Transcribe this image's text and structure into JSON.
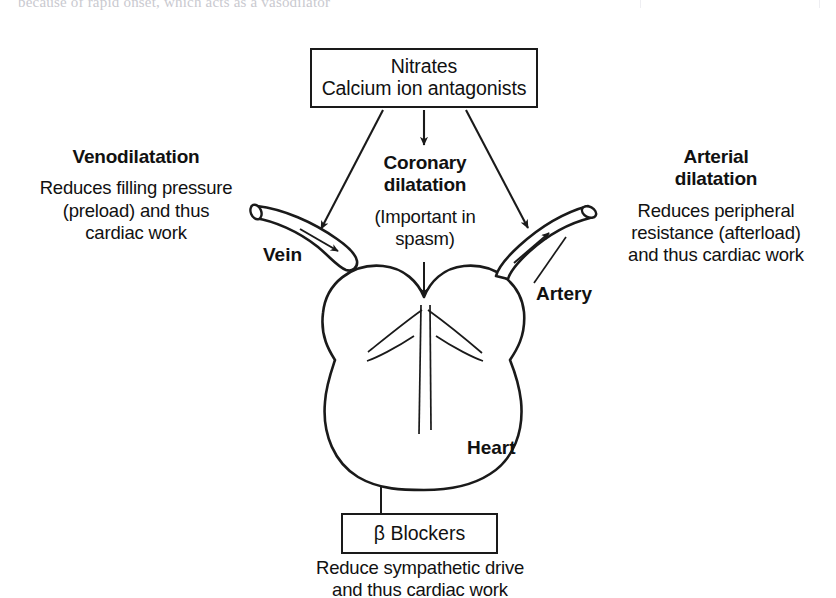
{
  "page": {
    "bleed_text_top": "because of rapid onset, which acts as a vasodilator",
    "background_color": "#ffffff",
    "ink_color": "#1a1a1a"
  },
  "diagram": {
    "drug_box": {
      "name": "drug-box",
      "lines": [
        "Nitrates",
        "Calcium ion antagonists"
      ]
    },
    "beta_box": {
      "name": "beta-blockers-box",
      "label": "β Blockers",
      "caption_lines": [
        "Reduce sympathetic drive",
        "and thus cardiac work"
      ]
    },
    "venodilatation": {
      "heading": "Venodilatation",
      "body_lines": [
        "Reduces filling pressure",
        "(preload) and thus",
        "cardiac work"
      ]
    },
    "coronary": {
      "heading_lines": [
        "Coronary",
        "dilatation"
      ],
      "body_lines": [
        "(Important in",
        "spasm)"
      ]
    },
    "arterial": {
      "heading_lines": [
        "Arterial",
        "dilatation"
      ],
      "body_lines": [
        "Reduces peripheral",
        "resistance (afterload)",
        "and thus cardiac work"
      ]
    },
    "anatomy_labels": {
      "vein": "Vein",
      "artery": "Artery",
      "heart": "Heart"
    },
    "arrows": [
      {
        "name": "arrow-drug-to-vein",
        "from": "drug-box",
        "to": "vein",
        "style": "diagonal-left"
      },
      {
        "name": "arrow-drug-to-coronary",
        "from": "drug-box",
        "to": "coronary-dilatation",
        "style": "vertical-short"
      },
      {
        "name": "arrow-drug-to-artery",
        "from": "drug-box",
        "to": "artery",
        "style": "diagonal-right"
      },
      {
        "name": "arrow-coronary-to-heart",
        "from": "coronary-dilatation",
        "to": "heart",
        "style": "vertical"
      },
      {
        "name": "arrow-beta-to-heart",
        "from": "beta-blockers-box",
        "to": "heart",
        "style": "vertical-up"
      },
      {
        "name": "leader-artery-label",
        "from": "artery-label",
        "to": "artery",
        "style": "leader-line"
      }
    ]
  }
}
